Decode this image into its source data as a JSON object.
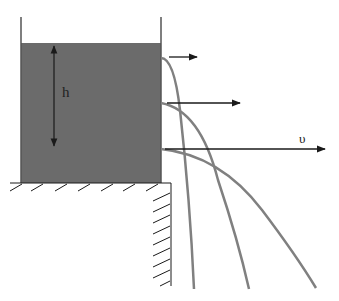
{
  "diagram": {
    "labels": {
      "height": "h",
      "velocity": "υ"
    },
    "colors": {
      "water": "#6b6b6b",
      "jets": "#808080",
      "lines": "#1a1a1a",
      "background": "#ffffff"
    },
    "tank": {
      "left_x": 21,
      "right_x": 161,
      "wall_top_y": 17,
      "water_top_y": 43,
      "bottom_y": 183
    },
    "jets": [
      {
        "name": "top-jet",
        "exit_y": 58,
        "arrow_end_x": 198,
        "landing_x": 194
      },
      {
        "name": "middle-jet",
        "exit_y": 103,
        "arrow_end_x": 240,
        "landing_x": 249
      },
      {
        "name": "bottom-jet",
        "exit_y": 149,
        "arrow_end_x": 325,
        "landing_x": 316
      }
    ]
  }
}
